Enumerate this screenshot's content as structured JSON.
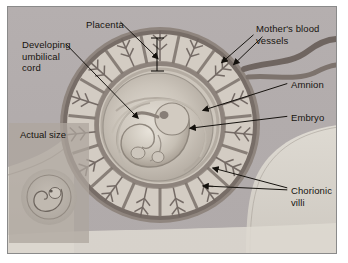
{
  "figure": {
    "background_color": "#b3adad",
    "frame_color": "#8a8a8a",
    "text_color": "#17140f",
    "leader_line_color": "#14110d"
  },
  "labels": [
    {
      "id": "placenta",
      "text": "Placenta",
      "x": 78,
      "y": 12
    },
    {
      "id": "umbilical-cord",
      "text": "Developing\numbilical\ncord",
      "x": 14,
      "y": 32
    },
    {
      "id": "mothers-vessels",
      "text": "Mother's blood\nvessels",
      "x": 248,
      "y": 16
    },
    {
      "id": "amnion",
      "text": "Amnion",
      "x": 283,
      "y": 72
    },
    {
      "id": "embryo",
      "text": "Embryo",
      "x": 283,
      "y": 105
    },
    {
      "id": "chorionic-villi",
      "text": "Chorionic\nvilli",
      "x": 283,
      "y": 178
    }
  ],
  "inset": {
    "caption": "Actual size",
    "illustration": "tiny-embryo-circle"
  },
  "structures": [
    {
      "name": "chorionic-villi-ring"
    },
    {
      "name": "placenta-layer"
    },
    {
      "name": "amniotic-sac"
    },
    {
      "name": "embryo-body"
    },
    {
      "name": "umbilical-cord"
    },
    {
      "name": "maternal-blood-vessels"
    },
    {
      "name": "uterine-wall"
    },
    {
      "name": "placenta-bracket"
    }
  ],
  "colors": {
    "villi_dark": "#6f6560",
    "villi_mid": "#8d837c",
    "villi_light": "#d8d2c9",
    "sac_light": "#cfc9c0",
    "sac_mid": "#b9b2a9",
    "embryo": "#c9c2b8",
    "wall_light": "#d9d5cd",
    "vessel": "#7d736d"
  }
}
